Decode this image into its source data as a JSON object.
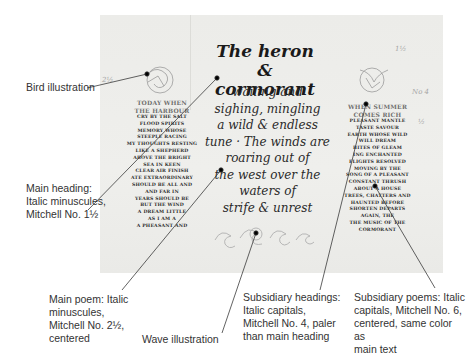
{
  "figure": {
    "heading": [
      "The heron",
      "& cormorant"
    ],
    "main_poem": [
      "wailing and",
      "sighing, mingling",
      "a wild & endless",
      "tune · The winds are",
      "roaring out of",
      "the west over the",
      "waters of",
      "strife & unrest"
    ],
    "left_subheading": [
      "TODAY WHEN",
      "THE HARBOUR"
    ],
    "left_poem": [
      "CRY BY THE SALT",
      "FLOOD SPIRITS",
      "MEMORY WHOSE",
      "STEEPLE RACING",
      "MY THOUGHTS RESTING",
      "LIKE A SHEPHERD",
      "ABOVE THE BRIGHT",
      "SEA IN KEEN",
      "CLEAR AIR FINISH",
      "ATE EXTRAORDINARY",
      "SHOULD BE ALL AND",
      "AND FAR IN",
      "YEARS SHOULD BE",
      "BUT THE WIND",
      "A DREAM LITTLE",
      "AS I AM A",
      "A PHEASANT AND"
    ],
    "right_subheading": [
      "WHEN SUMMER",
      "COMES RICH"
    ],
    "right_poem": [
      "PLEASANT MANTLE",
      "TASTE SAVOUR",
      "EARTH WHOSE WILD",
      "WILL DREAM",
      "BITES OF GLEAM",
      "ING ENCHANTED",
      "FLIGHTS RESOLVED",
      "MOVING BY THE",
      "SONG OF A PLEASANT",
      "CONSTANT THRUSH",
      "ABOUT A HOUSE",
      "TREES, CHATTERS AND",
      "HAUNTED BEFORE",
      "SHORTEN DEPARTS",
      "AGAIN, THE",
      "THE MUSIC OF THE",
      "CORMORANT"
    ],
    "pencil_notes": [
      "1½",
      "No 4",
      "½",
      "2½"
    ]
  },
  "callouts": {
    "bird": "Bird illustration",
    "main_heading": [
      "Main heading:",
      "Italic minuscules,",
      "Mitchell No. 1½"
    ],
    "main_poem": [
      "Main poem: Italic",
      "minuscules,",
      "Mitchell No. 2½,",
      "centered"
    ],
    "wave": "Wave illustration",
    "sub_headings": [
      "Subsidiary headings:",
      "Italic capitals,",
      "Mitchell No. 4, paler",
      "than main heading"
    ],
    "sub_poems": [
      "Subsidiary poems: Italic",
      "capitals, Mitchell No. 6,",
      "centered, same color as",
      "main text"
    ]
  },
  "colors": {
    "paper": "#ecece9",
    "ink": "#1a1a1a",
    "pale_ink": "#6e6e6e",
    "leader_line": "#3a3a3a",
    "callout_text": "#333333"
  }
}
